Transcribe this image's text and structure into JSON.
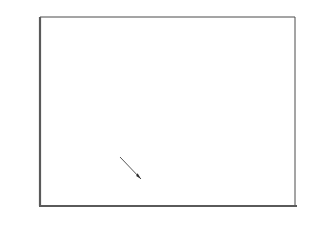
{
  "chart_data": {
    "type": "area",
    "xlabel": "",
    "ylabel": "Million Tons",
    "xlim": [
      1960,
      2020
    ],
    "ylim": [
      0,
      80
    ],
    "grid": true,
    "legend_position": "inline-annotations",
    "source": "Source: USDA",
    "x_ticks": [
      "1960",
      "1970",
      "1980",
      "1990",
      "2000",
      "2010",
      "2020"
    ],
    "y_ticks": [
      "0",
      "10",
      "20",
      "30",
      "40",
      "50",
      "60",
      "70",
      "80"
    ],
    "annotations": [
      {
        "text": "Consumption",
        "x": 2002,
        "y": 48
      },
      {
        "text": "Production",
        "x": 1974,
        "y": 22
      },
      {
        "text": "Imports",
        "x": 2003,
        "y": 23
      }
    ],
    "shaded_band": {
      "label": "Imports",
      "between": [
        "Production",
        "Consumption"
      ],
      "color": "#b5b5b5",
      "x_start": 1996,
      "x_end": 2012
    },
    "x": [
      1964,
      1965,
      1966,
      1967,
      1968,
      1969,
      1970,
      1971,
      1972,
      1973,
      1974,
      1975,
      1976,
      1977,
      1978,
      1979,
      1980,
      1981,
      1982,
      1983,
      1984,
      1985,
      1986,
      1987,
      1988,
      1989,
      1990,
      1991,
      1992,
      1993,
      1994,
      1995,
      1996,
      1997,
      1998,
      1999,
      2000,
      2001,
      2002,
      2003,
      2004,
      2005,
      2006,
      2007,
      2008,
      2009,
      2010,
      2011,
      2012
    ],
    "series": [
      {
        "name": "Consumption",
        "color": "#1a1a1a",
        "values": [
          7.0,
          6.2,
          6.0,
          6.6,
          7.2,
          6.9,
          7.4,
          6.6,
          8.1,
          6.8,
          7.3,
          7.0,
          6.9,
          7.2,
          6.8,
          7.0,
          7.6,
          7.5,
          7.6,
          8.0,
          8.4,
          8.6,
          9.0,
          9.6,
          10.6,
          11.2,
          11.5,
          10.0,
          9.2,
          9.6,
          11.0,
          12.0,
          14.6,
          13.5,
          14.2,
          16.4,
          20.0,
          23.5,
          27.5,
          31.5,
          34.0,
          38.5,
          45.0,
          50.0,
          53.0,
          57.0,
          62.0,
          68.0,
          68.0
        ]
      },
      {
        "name": "Production",
        "color": "#3a3a3a",
        "values": [
          7.0,
          6.2,
          6.0,
          6.6,
          7.2,
          6.9,
          7.4,
          6.6,
          8.1,
          6.8,
          7.3,
          7.0,
          6.9,
          7.2,
          6.8,
          7.0,
          7.6,
          7.5,
          7.6,
          8.0,
          8.4,
          8.6,
          9.0,
          9.6,
          10.6,
          11.2,
          11.5,
          10.0,
          9.2,
          9.6,
          11.0,
          12.0,
          13.2,
          12.6,
          12.8,
          13.6,
          14.2,
          13.4,
          14.0,
          13.0,
          13.6,
          12.6,
          13.2,
          12.0,
          12.8,
          11.6,
          11.2,
          11.4,
          11.2
        ]
      }
    ]
  }
}
